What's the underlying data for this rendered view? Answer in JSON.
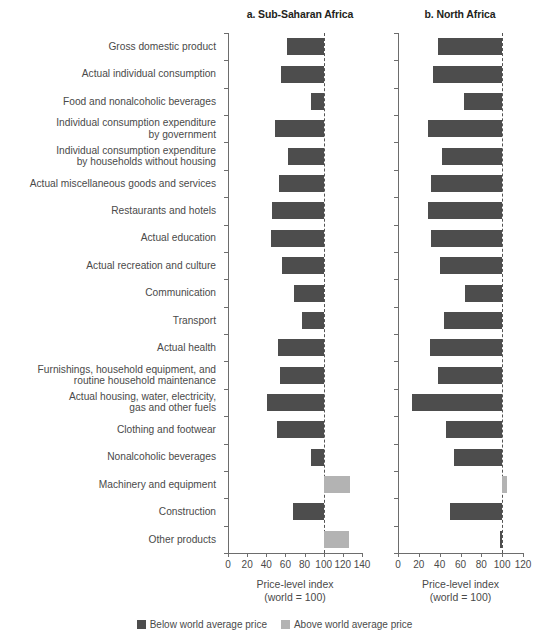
{
  "panels": [
    {
      "title": "a. Sub-Saharan Africa",
      "xlabel": "Price-level index\n(world = 100)"
    },
    {
      "title": "b. North Africa",
      "xlabel": "Price-level index\n(world = 100)"
    }
  ],
  "legend": [
    {
      "label": "Below world average price",
      "color": "#4d4d4d"
    },
    {
      "label": "Above world average price",
      "color": "#b3b3b3"
    }
  ],
  "chart_data": {
    "type": "bar",
    "orientation": "horizontal",
    "title": "",
    "reference_value": 100,
    "categories": [
      "Gross domestic product",
      "Actual individual consumption",
      "Food and nonalcoholic beverages",
      "Individual consumption expenditure\nby government",
      "Individual consumption expenditure\nby households without housing",
      "Actual miscellaneous goods and services",
      "Restaurants and hotels",
      "Actual education",
      "Actual recreation and culture",
      "Communication",
      "Transport",
      "Actual health",
      "Furnishings, household equipment, and\nroutine household maintenance",
      "Actual housing, water, electricity,\ngas and other fuels",
      "Clothing and footwear",
      "Nonalcoholic beverages",
      "Machinery and equipment",
      "Construction",
      "Other products"
    ],
    "series": [
      {
        "name": "a. Sub-Saharan Africa",
        "xlabel": "Price-level index\n(world = 100)",
        "xlim": [
          0,
          140
        ],
        "xticks": [
          0,
          20,
          40,
          60,
          80,
          100,
          120,
          140
        ],
        "values": [
          62,
          55,
          87,
          49,
          63,
          53,
          46,
          45,
          56,
          69,
          77,
          52,
          54,
          41,
          51,
          87,
          127,
          68,
          126
        ]
      },
      {
        "name": "b. North Africa",
        "xlabel": "Price-level index\n(world = 100)",
        "xlim": [
          0,
          120
        ],
        "xticks": [
          0,
          20,
          40,
          60,
          80,
          100,
          120
        ],
        "values": [
          38,
          34,
          63,
          29,
          42,
          32,
          29,
          32,
          40,
          64,
          44,
          31,
          38,
          13,
          46,
          54,
          105,
          50,
          98
        ]
      }
    ],
    "grid": false,
    "legend_position": "bottom"
  }
}
